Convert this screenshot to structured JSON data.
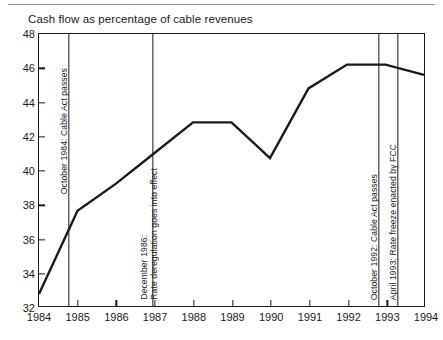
{
  "figure": {
    "title": "Cash flow as percentage of cable revenues"
  },
  "chart_data": {
    "type": "line",
    "title": "Cash flow as percentage of cable revenues",
    "xlabel": "",
    "ylabel": "",
    "xlim": [
      1984,
      1994
    ],
    "ylim": [
      32,
      48
    ],
    "grid": false,
    "legend": "none",
    "line_color": "#1a1a1a",
    "x": [
      1984,
      1985,
      1986,
      1987,
      1988,
      1989,
      1990,
      1991,
      1992,
      1993,
      1994
    ],
    "values": [
      32.7,
      37.6,
      39.2,
      41.0,
      42.8,
      42.8,
      40.7,
      44.8,
      46.2,
      46.2,
      45.6
    ],
    "xticks": [
      "1984",
      "1985",
      "1986",
      "1987",
      "1988",
      "1989",
      "1990",
      "1991",
      "1992",
      "1993",
      "1994"
    ],
    "yticks": [
      "32",
      "34",
      "36",
      "38",
      "40",
      "42",
      "44",
      "46",
      "48"
    ],
    "annotations": [
      {
        "x": 1984.78,
        "label": "October 1984: Cable Act passes",
        "label_line1": "October 1984: Cable Act passes",
        "label_line2": ""
      },
      {
        "x": 1986.95,
        "label": "December 1986: Rate deregulation goes into effect",
        "label_line1": "December 1986:",
        "label_line2": "Rate deregulation goes into effect"
      },
      {
        "x": 1992.78,
        "label": "October 1992: Cable Act passes",
        "label_line1": "October 1992: Cable Act passes",
        "label_line2": ""
      },
      {
        "x": 1993.27,
        "label": "April 1993: Rate freeze enacted by FCC",
        "label_line1": "April 1993: Rate freeze enacted by FCC",
        "label_line2": ""
      }
    ]
  }
}
